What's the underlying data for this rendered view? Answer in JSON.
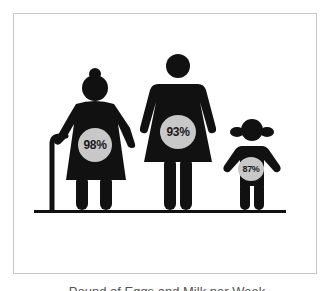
{
  "figures": [
    {
      "name": "grandmother",
      "value_label": "98%",
      "value": 98
    },
    {
      "name": "mother",
      "value_label": "93%",
      "value": 93
    },
    {
      "name": "child",
      "value_label": "87%",
      "value": 87
    }
  ],
  "caption": "Pound of Eggs and Milk per Week",
  "colors": {
    "figure": "#111111",
    "badge": "#c8c8c8",
    "frame": "#c8c8c8",
    "background": "#ffffff"
  }
}
